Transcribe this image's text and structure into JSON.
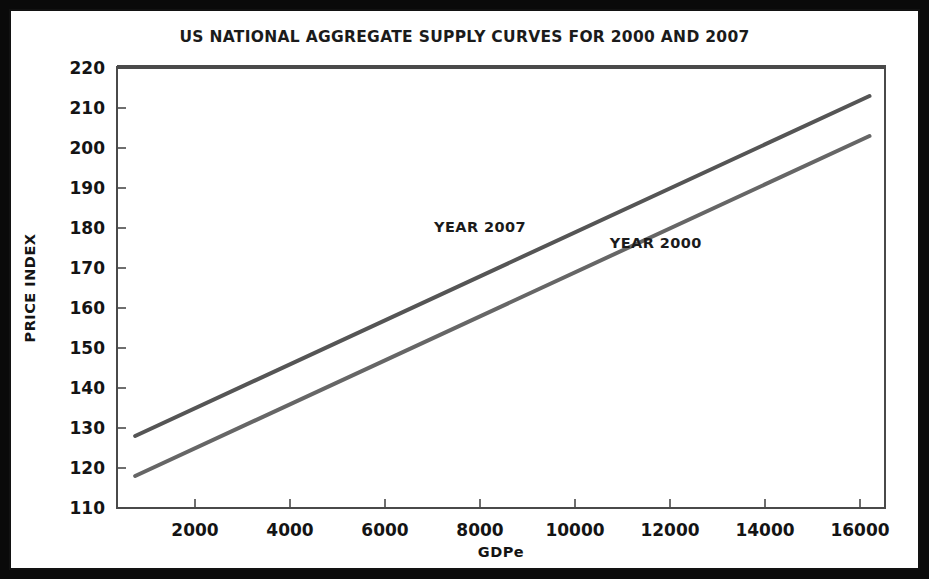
{
  "chart_data": {
    "type": "line",
    "title": "US NATIONAL AGGREGATE SUPPLY CURVES FOR 2000 AND 2007",
    "xlabel": "GDPe",
    "ylabel": "PRICE INDEX",
    "xlim": [
      360,
      16400
    ],
    "ylim": [
      110,
      220
    ],
    "xticks": [
      2000,
      4000,
      6000,
      8000,
      10000,
      12000,
      14000,
      16000
    ],
    "yticks": [
      110,
      120,
      130,
      140,
      150,
      160,
      170,
      180,
      190,
      200,
      210,
      220
    ],
    "xtick_labels": [
      "2000",
      "4000",
      "6000",
      "8000",
      "10000",
      "12000",
      "14000",
      "16000"
    ],
    "ytick_labels": [
      "110",
      "120",
      "130",
      "140",
      "150",
      "160",
      "170",
      "180",
      "190",
      "200",
      "210",
      "220"
    ],
    "grid": false,
    "legend_position": "inline-annotations",
    "series": [
      {
        "name": "YEAR 2007",
        "color": "#555555",
        "line_width": 4,
        "label_x": 8000,
        "label_y": 179,
        "x": [
          740,
          16200
        ],
        "values": [
          128,
          213
        ]
      },
      {
        "name": "YEAR 2000",
        "color": "#666666",
        "line_width": 4,
        "label_x": 11700,
        "label_y": 175,
        "x": [
          740,
          16200
        ],
        "values": [
          118,
          203
        ]
      }
    ],
    "annotations": [
      {
        "text": "YEAR 2007",
        "x": 8000,
        "y": 179
      },
      {
        "text": "YEAR 2000",
        "x": 11700,
        "y": 175
      }
    ]
  },
  "figure": {
    "frame_color": "#0a0a0a",
    "background_color": "#ffffff",
    "axis_color": "#4a4a4a",
    "text_color": "#141414"
  }
}
